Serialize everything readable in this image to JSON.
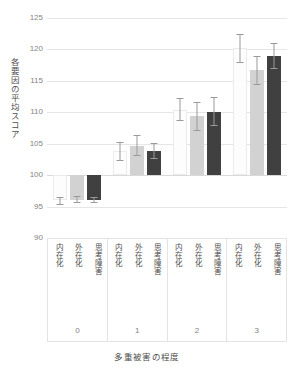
{
  "chart_data": {
    "type": "bar",
    "title": "",
    "xlabel": "多重被害の程度",
    "ylabel": "各要因の平均スコア",
    "ylim": [
      90,
      125
    ],
    "yticks": [
      90,
      95,
      100,
      105,
      110,
      115,
      120,
      125
    ],
    "grid": true,
    "legend": "none",
    "baseline": 100,
    "categories": [
      "0",
      "1",
      "2",
      "3"
    ],
    "subcategories": [
      "内在化",
      "外在化",
      "思考障害"
    ],
    "series": [
      {
        "name": "内在化",
        "color": "#fdfdfd",
        "values": [
          96.0,
          103.9,
          110.4,
          120.2
        ],
        "err_low": [
          95.2,
          102.3,
          108.6,
          117.9
        ],
        "err_high": [
          96.6,
          105.3,
          112.2,
          122.4
        ]
      },
      {
        "name": "外在化",
        "color": "#d2d2d2",
        "values": [
          96.1,
          104.7,
          109.4,
          116.7
        ],
        "err_low": [
          95.5,
          103.0,
          107.1,
          114.4
        ],
        "err_high": [
          96.7,
          106.4,
          111.6,
          118.9
        ]
      },
      {
        "name": "思考障害",
        "color": "#404040",
        "values": [
          96.0,
          103.8,
          110.1,
          119.0
        ],
        "err_low": [
          95.5,
          102.6,
          107.8,
          116.9
        ],
        "err_high": [
          96.6,
          105.1,
          112.4,
          121.0
        ]
      }
    ]
  },
  "table": {
    "groups": [
      {
        "number": "0",
        "cells": [
          "内在化",
          "外在化",
          "思考障害"
        ]
      },
      {
        "number": "1",
        "cells": [
          "内在化",
          "外在化",
          "思考障害"
        ]
      },
      {
        "number": "2",
        "cells": [
          "内在化",
          "外在化",
          "思考障害"
        ]
      },
      {
        "number": "3",
        "cells": [
          "内在化",
          "外在化",
          "思考障害"
        ]
      }
    ]
  },
  "axis": {
    "y_title": "各要因の平均スコア",
    "x_title": "多重被害の程度",
    "tick_labels": [
      "125",
      "120",
      "115",
      "110",
      "105",
      "100",
      "95",
      "90"
    ]
  }
}
